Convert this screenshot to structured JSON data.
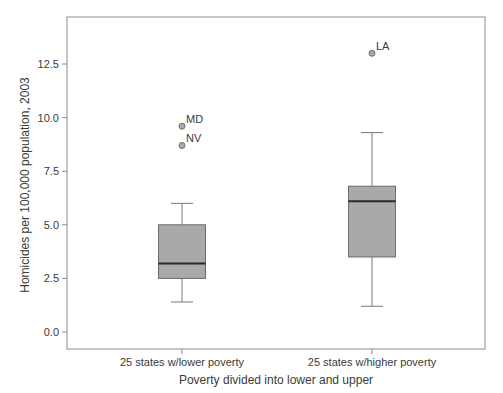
{
  "chart_data": {
    "type": "box",
    "title": "",
    "xlabel": "Poverty divided into lower and upper",
    "ylabel": "Homicides per 100,000 population, 2003",
    "ylim": [
      -0.8,
      14.4
    ],
    "yticks": [
      0.0,
      2.5,
      5.0,
      7.5,
      10.0,
      12.5
    ],
    "ytick_labels": [
      "0.0",
      "2.5",
      "5.0",
      "7.5",
      "10.0",
      "12.5"
    ],
    "grid": false,
    "legend": null,
    "categories": [
      "25 states w/lower poverty",
      "25 states w/higher poverty"
    ],
    "series": [
      {
        "name": "25 states w/lower poverty",
        "whisker_low": 1.4,
        "q1": 2.5,
        "median": 3.2,
        "q3": 5.0,
        "whisker_high": 6.0,
        "outliers": [
          {
            "label": "MD",
            "value": 9.6
          },
          {
            "label": "NV",
            "value": 8.7
          }
        ]
      },
      {
        "name": "25 states w/higher poverty",
        "whisker_low": 1.2,
        "q1": 3.5,
        "median": 6.1,
        "q3": 6.8,
        "whisker_high": 9.3,
        "outliers": [
          {
            "label": "LA",
            "value": 13.0
          }
        ]
      }
    ]
  },
  "colors": {
    "box_fill": "#a9a9ab",
    "box_stroke": "#6b6b6b",
    "median": "#2a2a2a",
    "whisker": "#7a7a7a",
    "outlier_fill": "#a9a9ab",
    "outlier_stroke": "#707070",
    "frame": "#8c8c8c",
    "text": "#3a3a3a"
  }
}
